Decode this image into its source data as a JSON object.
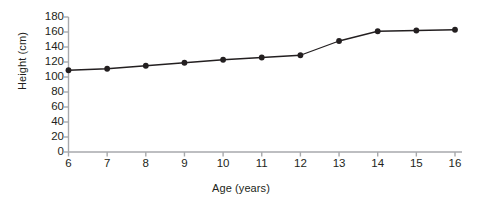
{
  "chart_data": {
    "type": "line",
    "title": "",
    "xlabel": "Age (years)",
    "ylabel": "Height (cm)",
    "x": [
      6,
      7,
      8,
      9,
      10,
      11,
      12,
      13,
      14,
      15,
      16
    ],
    "values": [
      109,
      111,
      115,
      119,
      123,
      126,
      129,
      148,
      161,
      162,
      163
    ],
    "series": [
      {
        "name": "Height",
        "values": [
          109,
          111,
          115,
          119,
          123,
          126,
          129,
          148,
          161,
          162,
          163
        ]
      }
    ],
    "xlim": [
      6,
      16
    ],
    "ylim": [
      0,
      180
    ],
    "x_ticks": [
      "6",
      "7",
      "8",
      "9",
      "10",
      "11",
      "12",
      "13",
      "14",
      "15",
      "16"
    ],
    "y_ticks": [
      "0",
      "20",
      "40",
      "60",
      "80",
      "100",
      "120",
      "140",
      "160",
      "180"
    ],
    "grid": false,
    "legend": "none",
    "marker": "filled-circle",
    "line_color": "#231f20",
    "axis_color": "#a7a9ac",
    "text_color": "#231f20"
  }
}
